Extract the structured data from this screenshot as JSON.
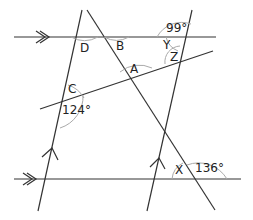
{
  "diagram": {
    "labels": {
      "D": "D",
      "B": "B",
      "Y": "Y",
      "Z": "Z",
      "A": "A",
      "C": "C",
      "X": "X",
      "angle_99": "99°",
      "angle_124": "124°",
      "angle_136": "136°"
    },
    "colors": {
      "line": "#333333",
      "arc": "#aaaaaa"
    }
  }
}
